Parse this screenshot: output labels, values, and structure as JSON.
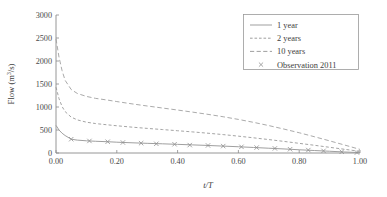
{
  "chart_data": {
    "type": "line",
    "title": "",
    "xlabel": "t/T",
    "ylabel": "Flow (m3/s)",
    "ylabel_parts": {
      "prefix": "Flow (m",
      "sup": "3",
      "suffix": "/s)"
    },
    "xlim": [
      0.0,
      1.0
    ],
    "ylim": [
      0,
      3000
    ],
    "xticks": [
      0.0,
      0.2,
      0.4,
      0.6,
      0.8,
      1.0
    ],
    "xticklabels": [
      "0.00",
      "0.20",
      "0.40",
      "0.60",
      "0.80",
      "1.00"
    ],
    "yticks": [
      0,
      500,
      1000,
      1500,
      2000,
      2500,
      3000
    ],
    "yticklabels": [
      "0",
      "500",
      "1000",
      "1500",
      "2000",
      "2500",
      "3000"
    ],
    "grid": false,
    "legend_position": "upper right",
    "x": [
      0.0,
      0.01,
      0.02,
      0.03,
      0.05,
      0.07,
      0.1,
      0.13,
      0.17,
      0.2,
      0.25,
      0.3,
      0.35,
      0.4,
      0.45,
      0.5,
      0.55,
      0.6,
      0.65,
      0.7,
      0.75,
      0.8,
      0.85,
      0.9,
      0.95,
      1.0
    ],
    "series": [
      {
        "name": "1 year",
        "style": "solid",
        "values": [
          600,
          500,
          430,
          380,
          300,
          280,
          265,
          255,
          245,
          235,
          222,
          210,
          200,
          188,
          176,
          164,
          150,
          136,
          120,
          104,
          88,
          70,
          54,
          38,
          22,
          8
        ]
      },
      {
        "name": "2 years",
        "style": "dashed",
        "values": [
          1430,
          1180,
          1010,
          900,
          780,
          720,
          670,
          640,
          612,
          592,
          562,
          535,
          510,
          484,
          458,
          430,
          400,
          366,
          330,
          292,
          252,
          210,
          168,
          124,
          80,
          36
        ]
      },
      {
        "name": "10 years",
        "style": "dashdot",
        "values": [
          2480,
          2080,
          1790,
          1580,
          1380,
          1295,
          1230,
          1188,
          1150,
          1118,
          1068,
          1022,
          978,
          934,
          888,
          840,
          788,
          730,
          666,
          596,
          520,
          440,
          354,
          264,
          172,
          78
        ]
      }
    ],
    "observation": {
      "name": "Observation 2011",
      "marker": "x",
      "x": [
        0.05,
        0.11,
        0.17,
        0.22,
        0.28,
        0.33,
        0.39,
        0.44,
        0.5,
        0.55,
        0.61,
        0.66,
        0.72,
        0.77,
        0.83,
        0.88,
        0.94,
        0.99
      ],
      "values": [
        300,
        262,
        245,
        228,
        214,
        200,
        190,
        172,
        164,
        150,
        134,
        118,
        100,
        82,
        64,
        46,
        26,
        10
      ]
    },
    "legend": [
      {
        "label": "1 year",
        "style": "solid"
      },
      {
        "label": "2 years",
        "style": "dashed"
      },
      {
        "label": "10 years",
        "style": "dashdot"
      },
      {
        "label": "Observation 2011",
        "style": "marker-x"
      }
    ],
    "colors": {
      "line": "#9a9a9a",
      "axis": "#8a8a8a",
      "text": "#3d3d3d",
      "background": "#ffffff"
    }
  }
}
